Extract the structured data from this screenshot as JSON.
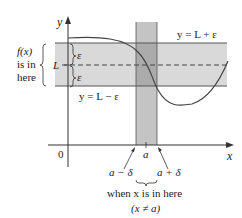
{
  "diagram": {
    "axes": {
      "x_label": "x",
      "y_label": "y",
      "origin_label": "0"
    },
    "band_labels": {
      "upper": "y = L + ε",
      "lower": "y = L − ε",
      "L": "L",
      "epsilon_upper": "ε",
      "epsilon_lower": "ε"
    },
    "left_note": {
      "line1": "f(x)",
      "line2": "is in",
      "line3": "here"
    },
    "x_marks": {
      "a": "a",
      "a_minus_delta": "a − δ",
      "a_plus_delta": "a + δ"
    },
    "bottom_note": {
      "line1": "when x is in here",
      "line2": "(x ≠ a)"
    },
    "colors": {
      "band": "#d6d6d6",
      "strip": "#bdbdbd",
      "overlap": "#a9a9a9",
      "line": "#555555",
      "curve": "#555555"
    }
  }
}
